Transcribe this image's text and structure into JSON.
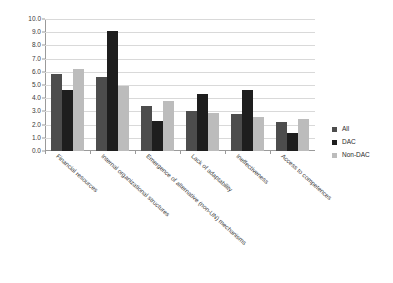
{
  "chart_data": {
    "type": "bar",
    "title": "",
    "subtitle": "",
    "xlabel": "",
    "ylabel": "",
    "ylim": [
      0,
      10
    ],
    "ytick_step": 1,
    "ytick_labels": [
      "0.0",
      "1.0",
      "2.0",
      "3.0",
      "4.0",
      "5.0",
      "6.0",
      "7.0",
      "8.0",
      "9.0",
      "10.0"
    ],
    "grid": true,
    "legend_position": "right",
    "categories": [
      "Financial resources",
      "Internal organizational structures",
      "Emergence of alternative (non-UN) mechanisms",
      "Lack of adaptability",
      "Ineffectiveness",
      "Access to competences"
    ],
    "series": [
      {
        "name": "All",
        "color": "#4d4d4d",
        "values": [
          5.8,
          5.6,
          3.4,
          3.0,
          2.8,
          2.2
        ]
      },
      {
        "name": "DAC",
        "color": "#1e1e1e",
        "values": [
          4.6,
          9.1,
          2.3,
          4.3,
          4.6,
          1.35
        ]
      },
      {
        "name": "Non-DAC",
        "color": "#bcbcbc",
        "values": [
          6.2,
          4.9,
          3.8,
          2.85,
          2.6,
          2.4
        ]
      }
    ]
  },
  "legend": {
    "items": [
      {
        "label": "All"
      },
      {
        "label": "DAC"
      },
      {
        "label": "Non-DAC"
      }
    ]
  }
}
